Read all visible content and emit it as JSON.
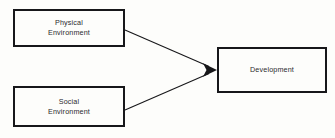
{
  "diagram": {
    "canvas": {
      "width": 335,
      "height": 138,
      "background": "#fdfdfb"
    },
    "stroke_color": "#17171a",
    "text_color": "#2a2a2d",
    "nodes": [
      {
        "id": "physical",
        "label": "Physical\nEnvironment",
        "line1": "Physical",
        "line2": "Environment",
        "shape": "rectangle",
        "x": 13,
        "y": 9,
        "width": 112,
        "height": 38
      },
      {
        "id": "social",
        "label": "Social\nEnvironment",
        "line1": "Social",
        "line2": "Environment",
        "shape": "rectangle",
        "x": 13,
        "y": 86,
        "width": 112,
        "height": 41
      },
      {
        "id": "development",
        "label": "Development",
        "line1": "Development",
        "line2": "",
        "shape": "rectangle",
        "x": 217,
        "y": 47,
        "width": 110,
        "height": 46
      }
    ],
    "edges": [
      {
        "id": "physical-to-development",
        "from": "physical",
        "to": "development",
        "label": "",
        "arrowhead": "filled-triangle",
        "x1": 125,
        "y1": 30,
        "x2": 217,
        "y2": 70
      },
      {
        "id": "social-to-development",
        "from": "social",
        "to": "development",
        "label": "",
        "arrowhead": "filled-triangle",
        "x1": 125,
        "y1": 110,
        "x2": 217,
        "y2": 70
      }
    ]
  }
}
